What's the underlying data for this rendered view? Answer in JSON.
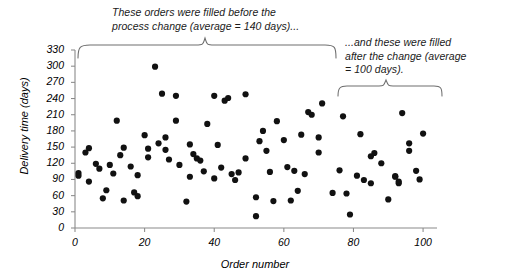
{
  "chart_data": {
    "type": "scatter",
    "title": "",
    "xlabel": "Order number",
    "ylabel": "Delivery time (days)",
    "xlim": [
      0,
      104
    ],
    "ylim": [
      0,
      330
    ],
    "xticks": [
      0,
      20,
      40,
      60,
      80,
      100
    ],
    "yticks": [
      0,
      30,
      60,
      90,
      120,
      150,
      180,
      210,
      240,
      270,
      300,
      330
    ],
    "grid": false,
    "legend": null,
    "marker": {
      "shape": "circle",
      "color": "#111111",
      "size": 3.1
    },
    "annotations": [
      {
        "name": "before-change",
        "text": "These orders were filled before the\nprocess change (average = 140 days)...",
        "brace_x_range": [
          1,
          72
        ],
        "average": 140
      },
      {
        "name": "after-change",
        "text": "...and these were filled\nafter the change (average\n= 100 days).",
        "brace_x_range": [
          74,
          101
        ],
        "average": 100
      }
    ],
    "x": [
      1,
      1,
      2,
      3,
      4,
      5,
      6,
      7,
      8,
      9,
      10,
      11,
      12,
      13,
      14,
      15,
      16,
      17,
      18,
      19,
      20,
      21,
      22,
      23,
      24,
      25,
      26,
      27,
      28,
      29,
      30,
      31,
      32,
      33,
      34,
      35,
      36,
      37,
      38,
      39,
      40,
      41,
      42,
      43,
      44,
      45,
      46,
      47,
      48,
      49,
      50,
      51,
      52,
      53,
      54,
      55,
      56,
      57,
      58,
      59,
      60,
      61,
      62,
      63,
      64,
      65,
      66,
      67,
      68,
      69,
      70,
      71,
      72,
      74,
      75,
      76,
      77,
      78,
      79,
      80,
      81,
      82,
      83,
      84,
      85,
      86,
      87,
      88,
      89,
      90,
      91,
      92,
      92,
      93,
      94,
      95,
      96,
      97,
      98,
      99,
      100
    ],
    "y": [
      102,
      97,
      140,
      148,
      86,
      119,
      110,
      55,
      70,
      117,
      101,
      199,
      135,
      149,
      51,
      114,
      66,
      59,
      98,
      172,
      131,
      147,
      299,
      157,
      249,
      168,
      145,
      127,
      245,
      199,
      117,
      49,
      155,
      95,
      137,
      129,
      125,
      105,
      193,
      92,
      245,
      154,
      112,
      236,
      241,
      100,
      89,
      103,
      248,
      129,
      22,
      57,
      161,
      180,
      143,
      50,
      104,
      198,
      51,
      163,
      113,
      69,
      106,
      173,
      100,
      215,
      210,
      231,
      168,
      140,
      65,
      207,
      64,
      107,
      25,
      97,
      89,
      174,
      83,
      139,
      133,
      120,
      53,
      95,
      96,
      83,
      86,
      213,
      157,
      143,
      106,
      90,
      175
    ],
    "points": [
      {
        "x": 1,
        "y": 102
      },
      {
        "x": 1,
        "y": 97
      },
      {
        "x": 3,
        "y": 140
      },
      {
        "x": 4,
        "y": 148
      },
      {
        "x": 4,
        "y": 86
      },
      {
        "x": 6,
        "y": 119
      },
      {
        "x": 7,
        "y": 110
      },
      {
        "x": 8,
        "y": 55
      },
      {
        "x": 9,
        "y": 70
      },
      {
        "x": 10,
        "y": 117
      },
      {
        "x": 11,
        "y": 101
      },
      {
        "x": 12,
        "y": 199
      },
      {
        "x": 13,
        "y": 135
      },
      {
        "x": 14,
        "y": 149
      },
      {
        "x": 14,
        "y": 51
      },
      {
        "x": 16,
        "y": 114
      },
      {
        "x": 17,
        "y": 66
      },
      {
        "x": 18,
        "y": 59
      },
      {
        "x": 18,
        "y": 98
      },
      {
        "x": 20,
        "y": 172
      },
      {
        "x": 21,
        "y": 131
      },
      {
        "x": 21,
        "y": 147
      },
      {
        "x": 23,
        "y": 299
      },
      {
        "x": 24,
        "y": 157
      },
      {
        "x": 25,
        "y": 249
      },
      {
        "x": 26,
        "y": 168
      },
      {
        "x": 26,
        "y": 145
      },
      {
        "x": 27,
        "y": 127
      },
      {
        "x": 29,
        "y": 245
      },
      {
        "x": 29,
        "y": 199
      },
      {
        "x": 30,
        "y": 117
      },
      {
        "x": 32,
        "y": 49
      },
      {
        "x": 33,
        "y": 155
      },
      {
        "x": 33,
        "y": 95
      },
      {
        "x": 34,
        "y": 137
      },
      {
        "x": 35,
        "y": 129
      },
      {
        "x": 36,
        "y": 125
      },
      {
        "x": 37,
        "y": 105
      },
      {
        "x": 38,
        "y": 193
      },
      {
        "x": 40,
        "y": 92
      },
      {
        "x": 40,
        "y": 245
      },
      {
        "x": 41,
        "y": 154
      },
      {
        "x": 42,
        "y": 112
      },
      {
        "x": 43,
        "y": 236
      },
      {
        "x": 44,
        "y": 241
      },
      {
        "x": 45,
        "y": 100
      },
      {
        "x": 46,
        "y": 89
      },
      {
        "x": 47,
        "y": 103
      },
      {
        "x": 49,
        "y": 248
      },
      {
        "x": 49,
        "y": 129
      },
      {
        "x": 52,
        "y": 22
      },
      {
        "x": 52,
        "y": 57
      },
      {
        "x": 53,
        "y": 161
      },
      {
        "x": 54,
        "y": 180
      },
      {
        "x": 55,
        "y": 143
      },
      {
        "x": 57,
        "y": 50
      },
      {
        "x": 56,
        "y": 104
      },
      {
        "x": 58,
        "y": 198
      },
      {
        "x": 62,
        "y": 51
      },
      {
        "x": 60,
        "y": 163
      },
      {
        "x": 61,
        "y": 113
      },
      {
        "x": 64,
        "y": 69
      },
      {
        "x": 63,
        "y": 106
      },
      {
        "x": 65,
        "y": 173
      },
      {
        "x": 66,
        "y": 100
      },
      {
        "x": 67,
        "y": 215
      },
      {
        "x": 68,
        "y": 210
      },
      {
        "x": 71,
        "y": 231
      },
      {
        "x": 70,
        "y": 168
      },
      {
        "x": 70,
        "y": 140
      },
      {
        "x": 74,
        "y": 65
      },
      {
        "x": 77,
        "y": 207
      },
      {
        "x": 78,
        "y": 64
      },
      {
        "x": 76,
        "y": 107
      },
      {
        "x": 79,
        "y": 25
      },
      {
        "x": 81,
        "y": 97
      },
      {
        "x": 83,
        "y": 89
      },
      {
        "x": 82,
        "y": 174
      },
      {
        "x": 85,
        "y": 83
      },
      {
        "x": 86,
        "y": 139
      },
      {
        "x": 85,
        "y": 133
      },
      {
        "x": 88,
        "y": 120
      },
      {
        "x": 90,
        "y": 53
      },
      {
        "x": 92,
        "y": 95
      },
      {
        "x": 92,
        "y": 96
      },
      {
        "x": 93,
        "y": 83
      },
      {
        "x": 93,
        "y": 86
      },
      {
        "x": 94,
        "y": 213
      },
      {
        "x": 96,
        "y": 157
      },
      {
        "x": 96,
        "y": 143
      },
      {
        "x": 98,
        "y": 106
      },
      {
        "x": 99,
        "y": 90
      },
      {
        "x": 100,
        "y": 175
      }
    ]
  },
  "axis": {
    "y_title": "Delivery time (days)",
    "x_title": "Order number",
    "y_tick_labels": [
      "330",
      "300",
      "270",
      "240",
      "210",
      "180",
      "150",
      "120",
      "90",
      "60",
      "30",
      "0"
    ],
    "x_tick_labels": [
      "0",
      "20",
      "40",
      "60",
      "80",
      "100"
    ]
  },
  "annotations": {
    "before": "These orders were filled before the\nprocess change (average = 140 days)...",
    "after": "...and these were filled\nafter the change (average\n= 100 days)."
  },
  "colors": {
    "marker": "#111111",
    "axis": "#8a8a8a",
    "brace": "#6e6e6e",
    "text": "#000000",
    "background": "#ffffff"
  }
}
